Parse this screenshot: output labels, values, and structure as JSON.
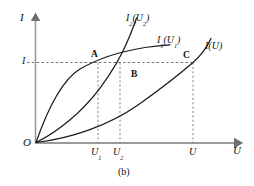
{
  "figure": {
    "caption": "(b)",
    "axes": {
      "y_axis_label": "I",
      "x_axis_label": "U",
      "origin_label": "O"
    },
    "ticks": {
      "y": [
        {
          "label": "I",
          "sub": ""
        }
      ],
      "x": [
        {
          "label": "U",
          "sub": "1"
        },
        {
          "label": "U",
          "sub": "2"
        },
        {
          "label": "U",
          "sub": ""
        }
      ]
    },
    "curves": [
      {
        "id": "curve-I1",
        "label_main": "I",
        "label_sub": "1",
        "label_arg_main": "U",
        "label_arg_sub": "1",
        "label_text": "I₁(U₁)",
        "shape": "concave-saturating"
      },
      {
        "id": "curve-I2",
        "label_main": "I",
        "label_sub": "2",
        "label_arg_main": "U",
        "label_arg_sub": "2",
        "label_text": "I₂(U₂)",
        "shape": "s-shaped-steep"
      },
      {
        "id": "curve-I",
        "label_main": "I",
        "label_sub": "",
        "label_arg_main": "U",
        "label_arg_sub": "",
        "label_text": "I(U)",
        "shape": "convex-rising"
      }
    ],
    "points": [
      {
        "name": "A",
        "on_curve": "curve-I1",
        "at_x_tick": "U1"
      },
      {
        "name": "B",
        "on_curve": "curve-I2",
        "at_x_tick": "U2"
      },
      {
        "name": "C",
        "on_curve": "curve-I",
        "at_x_tick": "U"
      }
    ],
    "colors": {
      "axis": "#9a9a9a",
      "curve": "#1a1a1a",
      "dashed": "#5a5a5a",
      "text": "#111111",
      "background": "#ffffff"
    }
  }
}
